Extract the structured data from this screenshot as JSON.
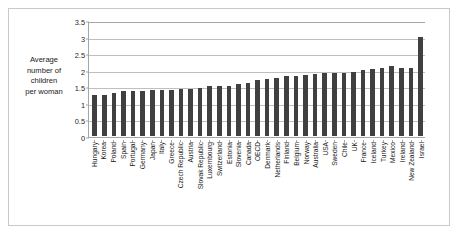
{
  "chart_data": {
    "type": "bar",
    "title": "",
    "xlabel": "",
    "ylabel": "Average number of children per woman",
    "ylabel_lines": [
      "Average",
      "number of",
      "children",
      "per woman"
    ],
    "ylim": [
      0,
      3.5
    ],
    "yticks": [
      0,
      0.5,
      1,
      1.5,
      2,
      2.5,
      3,
      3.5
    ],
    "ytick_labels": [
      "0",
      "0.5",
      "1",
      "1.5",
      "2",
      "2.5",
      "3",
      "3.5"
    ],
    "grid": true,
    "legend": "none",
    "bar_color": "#404040",
    "gridline_color": "#bfbfbf",
    "axis_color": "#a6a6a6",
    "categories": [
      "Hungary",
      "Korea",
      "Poland",
      "Spain",
      "Portugal",
      "Germany",
      "Japan",
      "Italy",
      "Greece",
      "Czech Republic",
      "Austria",
      "Slovak Republic",
      "Luxembourg",
      "Switzerland",
      "Estonia",
      "Slovenia",
      "Canada",
      "OECD",
      "Denmark",
      "Netherlands",
      "Finland",
      "Belgium",
      "Norway",
      "Australia",
      "USA",
      "Sweden",
      "Chile",
      "UK",
      "France",
      "Iceland",
      "Turkey",
      "Mexico",
      "Ireland",
      "New Zealand",
      "Israel"
    ],
    "values": [
      1.23,
      1.23,
      1.3,
      1.36,
      1.36,
      1.36,
      1.39,
      1.4,
      1.4,
      1.43,
      1.43,
      1.45,
      1.5,
      1.52,
      1.52,
      1.57,
      1.61,
      1.7,
      1.73,
      1.76,
      1.8,
      1.81,
      1.85,
      1.88,
      1.89,
      1.9,
      1.9,
      1.92,
      2.0,
      2.02,
      2.05,
      2.1,
      2.05,
      2.05,
      3.0
    ]
  }
}
